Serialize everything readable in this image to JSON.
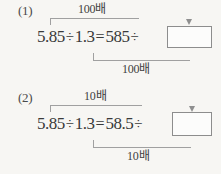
{
  "page": {
    "background_color": "#f7f6f3",
    "ink_color": "#3a3a3a",
    "rule_color": "#a0a0a0",
    "box_border_color": "#8d8d8d"
  },
  "problems": [
    {
      "number_label": "(1)",
      "equation": {
        "left_operand": "5.85",
        "divide_sign": "÷",
        "right_operand": "1.3",
        "equals_sign": "=",
        "result_left": "585",
        "result_divide_sign": "÷",
        "answer_value": ""
      },
      "top_bracket": {
        "label": "100배",
        "arrow": "down-arrow"
      },
      "bottom_bracket": {
        "label": "100배",
        "arrow": "up-arrow"
      }
    },
    {
      "number_label": "(2)",
      "equation": {
        "left_operand": "5.85",
        "divide_sign": "÷",
        "right_operand": "1.3",
        "equals_sign": "=",
        "result_left": "58.5",
        "result_divide_sign": "÷",
        "answer_value": ""
      },
      "top_bracket": {
        "label": "10배",
        "arrow": "down-arrow"
      },
      "bottom_bracket": {
        "label": "10배",
        "arrow": "up-arrow"
      }
    }
  ]
}
